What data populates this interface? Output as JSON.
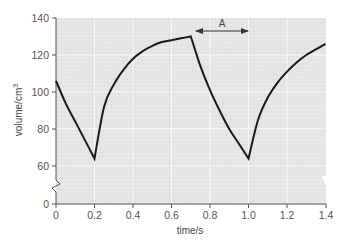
{
  "chart_data": {
    "type": "line",
    "title": "",
    "xlabel": "time/s",
    "ylabel": "volume/cm³",
    "ylabel_base": "volume/cm",
    "ylabel_sup": "3",
    "xlim": [
      0,
      1.4
    ],
    "ylim": [
      0,
      140
    ],
    "y_axis_break": {
      "between": [
        0,
        60
      ]
    },
    "grid": true,
    "x_ticks": [
      "0",
      "0.2",
      "0.4",
      "0.6",
      "0.8",
      "1.0",
      "1.2",
      "1.4"
    ],
    "y_ticks": [
      "0",
      "60",
      "80",
      "100",
      "120",
      "140"
    ],
    "series": [
      {
        "name": "volume",
        "x": [
          0,
          0.05,
          0.1,
          0.15,
          0.2,
          0.2,
          0.25,
          0.3,
          0.35,
          0.4,
          0.45,
          0.5,
          0.55,
          0.6,
          0.65,
          0.7,
          0.7,
          0.75,
          0.8,
          0.85,
          0.9,
          0.95,
          1.0,
          1.0,
          1.05,
          1.1,
          1.15,
          1.2,
          1.25,
          1.3,
          1.35,
          1.4
        ],
        "values": [
          106,
          94,
          84,
          74,
          64,
          64,
          92,
          104,
          112,
          118,
          122,
          125,
          127,
          128,
          129,
          130,
          130,
          114,
          101,
          90,
          80,
          72,
          64,
          64,
          85,
          97,
          105,
          111,
          116,
          120,
          123,
          126
        ]
      }
    ],
    "annotations": [
      {
        "type": "double-arrow",
        "label": "A",
        "x_start": 0.7,
        "x_end": 1.0,
        "y": 131
      }
    ]
  },
  "colors": {
    "grid_background": "#e4e4e4",
    "grid_line": "#f4f4f4",
    "curve": "#1a1a1a",
    "axis": "#555555"
  }
}
